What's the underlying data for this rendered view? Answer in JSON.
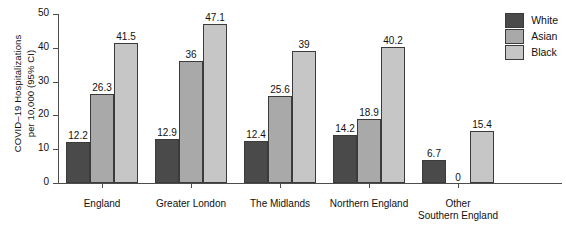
{
  "chart_data": {
    "type": "bar",
    "title": "",
    "xlabel": "",
    "ylabel": "COVID–19 Hospitalizations per 10,000 (95% CI)",
    "ylabel_line1": "COVID–19 Hospitalizations",
    "ylabel_line2": "per 10,000 (95% CI)",
    "ylim": [
      0,
      50
    ],
    "yticks": [
      0,
      10,
      20,
      30,
      40,
      50
    ],
    "ytick_labels": [
      "0",
      "10",
      "20",
      "30",
      "40",
      "50"
    ],
    "grid": false,
    "legend_position": "top-right",
    "categories": [
      "England",
      "Greater London",
      "The Midlands",
      "Northern England",
      "Other Southern England"
    ],
    "category_label_lines": [
      [
        "England"
      ],
      [
        "Greater London"
      ],
      [
        "The Midlands"
      ],
      [
        "Northern England"
      ],
      [
        "Other",
        "Southern England"
      ]
    ],
    "series": [
      {
        "name": "White",
        "color": "#4a4a4a",
        "values": [
          12.2,
          12.9,
          12.4,
          14.2,
          6.7
        ],
        "labels": [
          "12.2",
          "12.9",
          "12.4",
          "14.2",
          "6.7"
        ]
      },
      {
        "name": "Asian",
        "color": "#a9a9a9",
        "values": [
          26.3,
          36,
          25.6,
          18.9,
          0
        ],
        "labels": [
          "26.3",
          "36",
          "25.6",
          "18.9",
          "0"
        ]
      },
      {
        "name": "Black",
        "color": "#c6c6c6",
        "values": [
          41.5,
          47.1,
          39,
          40.2,
          15.4
        ],
        "labels": [
          "41.5",
          "47.1",
          "39",
          "40.2",
          "15.4"
        ]
      }
    ]
  },
  "legend": {
    "items": [
      {
        "label": "White",
        "color": "#4a4a4a"
      },
      {
        "label": "Asian",
        "color": "#a9a9a9"
      },
      {
        "label": "Black",
        "color": "#c6c6c6"
      }
    ]
  },
  "axis": {
    "y_tick_labels": [
      "0",
      "10",
      "20",
      "30",
      "40",
      "50"
    ]
  }
}
